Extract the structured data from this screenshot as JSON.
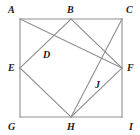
{
  "figure": {
    "stroke_color": "#8f8f8f",
    "label_color": "#1a1a1a",
    "background_color": "#ffffff",
    "stroke_width": 1.1,
    "square": {
      "name": "outer-square",
      "left": 20,
      "top": 19,
      "right": 122,
      "bottom": 117
    },
    "points": [
      {
        "id": "A",
        "label": "A",
        "x": 20,
        "y": 19,
        "role": "square-corner-top-left"
      },
      {
        "id": "B",
        "label": "B",
        "x": 71,
        "y": 19,
        "role": "midpoint-top"
      },
      {
        "id": "C",
        "label": "C",
        "x": 122,
        "y": 19,
        "role": "square-corner-top-right"
      },
      {
        "id": "E",
        "label": "E",
        "x": 20,
        "y": 68,
        "role": "midpoint-left"
      },
      {
        "id": "F",
        "label": "F",
        "x": 122,
        "y": 68,
        "role": "midpoint-right"
      },
      {
        "id": "G",
        "label": "G",
        "x": 20,
        "y": 117,
        "role": "square-corner-bottom-left"
      },
      {
        "id": "H",
        "label": "H",
        "x": 71,
        "y": 117,
        "role": "midpoint-bottom"
      },
      {
        "id": "I",
        "label": "I",
        "x": 122,
        "y": 117,
        "role": "square-corner-bottom-right"
      },
      {
        "id": "D",
        "label": "D",
        "x": 45,
        "y": 44,
        "role": "intersection-upper-left"
      },
      {
        "id": "J",
        "label": "J",
        "x": 97,
        "y": 93,
        "role": "intersection-lower-right"
      }
    ],
    "segments": [
      {
        "name": "square-top-edge",
        "from": "A",
        "to": "C"
      },
      {
        "name": "square-right-edge",
        "from": "C",
        "to": "I"
      },
      {
        "name": "square-bottom-edge",
        "from": "I",
        "to": "G"
      },
      {
        "name": "square-left-edge",
        "from": "G",
        "to": "A"
      },
      {
        "name": "diamond-edge-be",
        "from": "B",
        "to": "E"
      },
      {
        "name": "diamond-edge-eh",
        "from": "E",
        "to": "H"
      },
      {
        "name": "diamond-edge-hf",
        "from": "H",
        "to": "F"
      },
      {
        "name": "diamond-edge-fb",
        "from": "F",
        "to": "B"
      },
      {
        "name": "diagonal-a-f",
        "from": "A",
        "to": "F"
      },
      {
        "name": "diagonal-c-h",
        "from": "C",
        "to": "H"
      }
    ],
    "labels": [
      {
        "id": "A",
        "text": "A",
        "left": 8,
        "top": 5
      },
      {
        "id": "B",
        "text": "B",
        "left": 67,
        "top": 5
      },
      {
        "id": "C",
        "text": "C",
        "left": 126,
        "top": 5
      },
      {
        "id": "E",
        "text": "E",
        "left": 8,
        "top": 63
      },
      {
        "id": "F",
        "text": "F",
        "left": 127,
        "top": 63
      },
      {
        "id": "G",
        "text": "G",
        "left": 8,
        "top": 122
      },
      {
        "id": "H",
        "text": "H",
        "left": 67,
        "top": 122
      },
      {
        "id": "I",
        "text": "I",
        "left": 129,
        "top": 122
      },
      {
        "id": "D",
        "text": "D",
        "left": 43,
        "top": 50
      },
      {
        "id": "J",
        "text": "J",
        "left": 95,
        "top": 80
      }
    ]
  }
}
